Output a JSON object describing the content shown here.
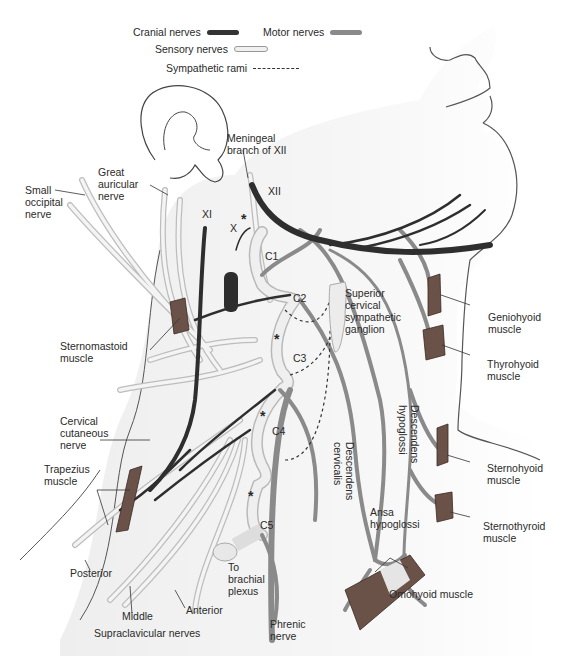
{
  "legend": {
    "cranial": {
      "label": "Cranial nerves",
      "color": "#333333"
    },
    "motor": {
      "label": "Motor nerves",
      "color": "#8a8a8a"
    },
    "sensory": {
      "label": "Sensory nerves",
      "color": "#f0f0f0"
    },
    "sympathetic": {
      "label": "Sympathetic rami",
      "style": "dashed"
    }
  },
  "labels": {
    "meningeal": "Meningeal\nbranch of XII",
    "xii": "XII",
    "xi": "XI",
    "x": "X",
    "c1": "C1",
    "c2": "C2",
    "c3": "C3",
    "c4": "C4",
    "c5": "C5",
    "star": "*",
    "great_auricular": "Great\nauricular\nnerve",
    "small_occipital": "Small\noccipital\nnerve",
    "sternomastoid": "Sternomastoid\nmuscle",
    "superior_cervical": "Superior\ncervical\nsympathetic\nganglion",
    "geniohyoid": "Geniohyoid\nmuscle",
    "thyrohyoid": "Thyrohyoid\nmuscle",
    "cervical_cutaneous": "Cervical\ncutaneous\nnerve",
    "trapezius": "Trapezius\nmuscle",
    "descendens_cervicalis": "Descendens\ncervicalis",
    "descendens_hypoglossi": "Descendens\nhypoglossi",
    "sternohyoid": "Sternohyoid\nmuscle",
    "sternothyroid": "Sternothyroid\nmuscle",
    "ansa": "Ansa\nhypoglossi",
    "omohyoid": "Omohyoid muscle",
    "posterior": "Posterior",
    "middle": "Middle",
    "anterior": "Anterior",
    "supraclavicular": "Supraclavicular nerves",
    "brachial": "To\nbrachial\nplexus",
    "phrenic": "Phrenic\nnerve"
  }
}
